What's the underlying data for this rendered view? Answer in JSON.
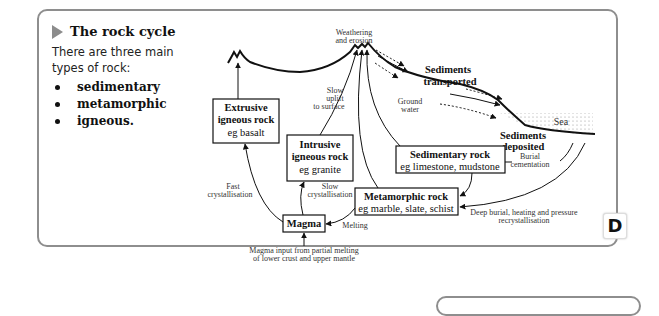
{
  "section": {
    "title": "The rock cycle",
    "intro": "There are three main types of rock:",
    "rock_types": [
      "sedimentary",
      "metamorphic",
      "igneous."
    ],
    "badge": "D"
  },
  "diagram": {
    "boxes": {
      "extrusive": {
        "title_line1": "Extrusive",
        "title_line2": "igneous rock",
        "example": "eg basalt"
      },
      "intrusive": {
        "title_line1": "Intrusive",
        "title_line2": "igneous rock",
        "example": "eg granite"
      },
      "sedimentary": {
        "title": "Sedimentary rock",
        "example": "eg limestone, mudstone"
      },
      "metamorphic": {
        "title": "Metamorphic rock",
        "example": "eg marble, slate, schist"
      },
      "magma": {
        "title": "Magma"
      }
    },
    "labels": {
      "weathering_1": "Weathering",
      "weathering_2": "and erosion",
      "transported_1": "Sediments",
      "transported_2": "transported",
      "ground_water_1": "Ground",
      "ground_water_2": "water",
      "sea": "Sea",
      "deposited_1": "Sediments",
      "deposited_2": "deposited",
      "burial_1": "Burial",
      "burial_2": "cementation",
      "slow_uplift_1": "Slow",
      "slow_uplift_2": "uplift",
      "slow_uplift_3": "to surface",
      "fast_cryst_1": "Fast",
      "fast_cryst_2": "crystallisation",
      "slow_cryst_1": "Slow",
      "slow_cryst_2": "crystallisation",
      "melting": "Melting",
      "deep_burial_1": "Deep burial, heating and pressure",
      "deep_burial_2": "recrystallisation",
      "magma_input_1": "Magma input from partial melting",
      "magma_input_2": "of lower crust and upper mantle"
    }
  }
}
